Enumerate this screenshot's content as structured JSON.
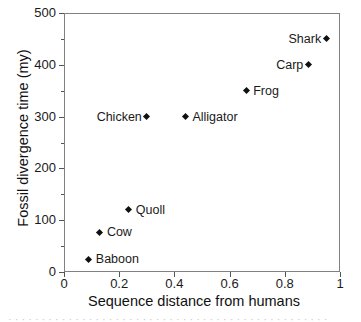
{
  "chart_data": {
    "type": "scatter",
    "title": "",
    "xlabel": "Sequence distance from humans",
    "ylabel": "Fossil divergence time (my)",
    "xlim": [
      0,
      1
    ],
    "ylim": [
      0,
      500
    ],
    "grid": false,
    "legend": "none",
    "marker": "diamond",
    "marker_color": "#101010",
    "xticks": [
      "0",
      "0.2",
      "0.4",
      "0.6",
      "0.8",
      "1"
    ],
    "xtick_values": [
      0,
      0.2,
      0.4,
      0.6,
      0.8,
      1
    ],
    "yticks": [
      "0",
      "100",
      "200",
      "300",
      "400",
      "500"
    ],
    "ytick_values": [
      0,
      100,
      200,
      300,
      400,
      500
    ],
    "yminor_values": [
      50,
      150,
      250,
      350,
      450
    ],
    "points": [
      {
        "label": "Shark",
        "x": 0.95,
        "y": 450,
        "label_side": "left"
      },
      {
        "label": "Carp",
        "x": 0.885,
        "y": 400,
        "label_side": "left"
      },
      {
        "label": "Frog",
        "x": 0.66,
        "y": 350,
        "label_side": "right"
      },
      {
        "label": "Alligator",
        "x": 0.44,
        "y": 300,
        "label_side": "right"
      },
      {
        "label": "Chicken",
        "x": 0.3,
        "y": 300,
        "label_side": "left"
      },
      {
        "label": "Quoll",
        "x": 0.235,
        "y": 120,
        "label_side": "right"
      },
      {
        "label": "Cow",
        "x": 0.13,
        "y": 77,
        "label_side": "right"
      },
      {
        "label": "Baboon",
        "x": 0.09,
        "y": 25,
        "label_side": "right"
      }
    ]
  },
  "caption_remnant": "· · · · · · · · · · · · · · · · · · · · · · · · · · · · · · · · · · · · · · · · · · · · · · · ·"
}
